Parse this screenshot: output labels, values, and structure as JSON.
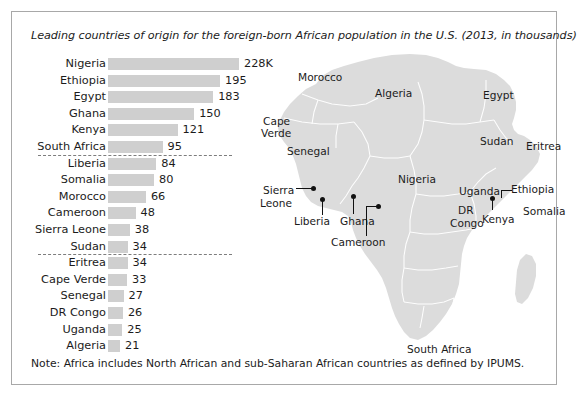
{
  "figure": {
    "title": "Leading countries of origin for the foreign-born African population in the U.S. (2013, in thousands)",
    "note": "Note: Africa includes North African and sub-Saharan African countries as defined by IPUMS.",
    "bar_color": "#cfcfcf",
    "map_color": "#dcdcdc",
    "text_color": "#1b1b1b",
    "border_color": "#a8a8a8"
  },
  "chart_data": {
    "type": "bar",
    "orientation": "horizontal",
    "title": "Leading countries of origin for the foreign-born African population in the U.S. (2013, in thousands)",
    "xlabel": "",
    "ylabel": "",
    "units": "thousands",
    "grid": false,
    "legend": "none",
    "xlim": [
      0,
      228
    ],
    "categories": [
      "Nigeria",
      "Ethiopia",
      "Egypt",
      "Ghana",
      "Kenya",
      "South Africa",
      "Liberia",
      "Somalia",
      "Morocco",
      "Cameroon",
      "Sierra Leone",
      "Sudan",
      "Eritrea",
      "Cape Verde",
      "Senegal",
      "DR Congo",
      "Uganda",
      "Algeria"
    ],
    "values": [
      228,
      195,
      183,
      150,
      121,
      95,
      84,
      80,
      66,
      48,
      38,
      34,
      34,
      33,
      27,
      26,
      25,
      21
    ],
    "value_labels": [
      "228K",
      "195",
      "183",
      "150",
      "121",
      "95",
      "84",
      "80",
      "66",
      "48",
      "38",
      "34",
      "34",
      "33",
      "27",
      "26",
      "25",
      "21"
    ],
    "group_dividers_after": [
      "South Africa",
      "Sudan"
    ],
    "note": "Note: Africa includes North African and sub-Saharan African countries as defined by IPUMS."
  },
  "map": {
    "name": "africa-map",
    "labels": [
      {
        "name": "morocco",
        "text": "Morocco",
        "x": 40,
        "y": 48
      },
      {
        "name": "algeria",
        "text": "Algeria",
        "x": 117,
        "y": 64
      },
      {
        "name": "egypt",
        "text": "Egypt",
        "x": 225,
        "y": 66
      },
      {
        "name": "cape-verde",
        "text": "Cape",
        "x": 5,
        "y": 92
      },
      {
        "name": "cape-verde-2",
        "text": "Verde",
        "x": 3,
        "y": 104
      },
      {
        "name": "sudan",
        "text": "Sudan",
        "x": 222,
        "y": 112
      },
      {
        "name": "eritrea",
        "text": "Eritrea",
        "x": 268,
        "y": 117
      },
      {
        "name": "senegal",
        "text": "Senegal",
        "x": 29,
        "y": 122
      },
      {
        "name": "nigeria",
        "text": "Nigeria",
        "x": 140,
        "y": 150
      },
      {
        "name": "uganda",
        "text": "Uganda",
        "x": 201,
        "y": 162
      },
      {
        "name": "ethiopia",
        "text": "Ethiopia",
        "x": 253,
        "y": 160
      },
      {
        "name": "sierra-leone",
        "text": "Sierra",
        "x": 5,
        "y": 161
      },
      {
        "name": "sierra-leone-2",
        "text": "Leone",
        "x": 2,
        "y": 174
      },
      {
        "name": "somalia",
        "text": "Somalia",
        "x": 265,
        "y": 182
      },
      {
        "name": "dr-congo",
        "text": "DR",
        "x": 200,
        "y": 181
      },
      {
        "name": "dr-congo-2",
        "text": "Congo",
        "x": 192,
        "y": 194
      },
      {
        "name": "kenya",
        "text": "Kenya",
        "x": 224,
        "y": 190
      },
      {
        "name": "liberia",
        "text": "Liberia",
        "x": 36,
        "y": 192
      },
      {
        "name": "ghana",
        "text": "Ghana",
        "x": 82,
        "y": 192
      },
      {
        "name": "cameroon",
        "text": "Cameroon",
        "x": 73,
        "y": 213
      },
      {
        "name": "south-africa",
        "text": "South Africa",
        "x": 149,
        "y": 320
      }
    ]
  }
}
